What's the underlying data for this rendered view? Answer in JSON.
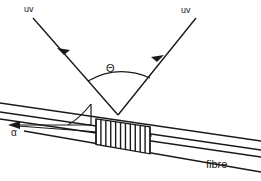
{
  "figure": {
    "background_color": "#ffffff",
    "line_color": "#1a1a1a",
    "width": 261,
    "height": 181
  },
  "labels": {
    "uv_left": "uv",
    "uv_right": "uv",
    "theta": "Θ",
    "alpha": "α",
    "fibre": "fibre"
  },
  "beams": [
    {
      "name": "uv-beam-left",
      "label": "uv",
      "from": [
        33,
        18
      ],
      "to": [
        118,
        115
      ],
      "arrowhead_at": [
        64,
        55
      ],
      "direction": "down-right"
    },
    {
      "name": "uv-beam-right",
      "label": "uv",
      "from": [
        196,
        18
      ],
      "to": [
        118,
        115
      ],
      "arrowhead_at": [
        157,
        62
      ],
      "direction": "down-left"
    }
  ],
  "angle_markers": [
    {
      "name": "theta-arc",
      "symbol": "Θ",
      "vertex": [
        118,
        115
      ],
      "between": [
        "uv-beam-left",
        "uv-beam-right"
      ],
      "radius": 42
    },
    {
      "name": "alpha-arc",
      "symbol": "α",
      "vertex": [
        91,
        125
      ],
      "between": [
        "fibre-axis",
        "alpha-reference-arrow"
      ],
      "radius": 24
    }
  ],
  "fibre": {
    "name": "fibre",
    "label": "fibre",
    "cladding_top_line": {
      "from": [
        0,
        103
      ],
      "to": [
        261,
        141
      ]
    },
    "cladding_bottom_line": {
      "from": [
        0,
        112
      ],
      "to": [
        261,
        170
      ]
    },
    "core_top_line": {
      "from": [
        0,
        112
      ],
      "to": [
        261,
        150
      ]
    },
    "core_bottom_line": {
      "from": [
        0,
        119
      ],
      "to": [
        261,
        158
      ]
    },
    "axis_line": {
      "from": [
        12,
        126
      ],
      "to": [
        261,
        163
      ]
    }
  },
  "grating": {
    "name": "bragg-grating",
    "fringe_count": 12,
    "start_x": 96,
    "end_x": 150,
    "description": "periodic index-modulation fringes written into the fibre core"
  },
  "reference_arrow": {
    "name": "alpha-reference-arrow",
    "from": [
      91,
      125
    ],
    "to": [
      8,
      125
    ],
    "direction": "left"
  }
}
